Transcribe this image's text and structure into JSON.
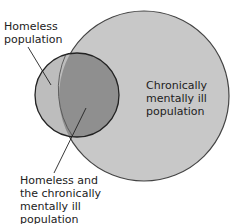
{
  "diagram": {
    "type": "venn",
    "sets": [
      {
        "id": "homeless",
        "label": "Homeless population"
      },
      {
        "id": "mentally_ill",
        "label": "Chronically mentally ill population"
      }
    ],
    "intersection_label": "Homeless and the chronically mentally ill population",
    "colors": {
      "large_circle_fill": "#c8c8c8",
      "small_circle_fill": "#bdbdbd",
      "intersection_fill": "#8f8f8f",
      "stroke": "#333333"
    }
  },
  "labels": {
    "homeless": [
      "Homeless",
      "population"
    ],
    "mentally_ill": [
      "Chronically",
      "mentally ill",
      "population"
    ],
    "intersection": [
      "Homeless and",
      "the chronically",
      "mentally ill",
      "population"
    ]
  }
}
